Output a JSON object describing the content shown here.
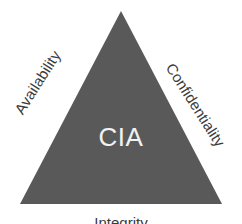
{
  "diagram": {
    "type": "triangle",
    "center_label": "CIA",
    "center_label_color": "#f2f2f2",
    "shape_fill_color": "#595959",
    "background_color": "#ffffff",
    "label_color": "#3b3b3b",
    "edges": [
      {
        "id": "availability",
        "label": "Availability",
        "side": "left",
        "rotation_deg": -57.5
      },
      {
        "id": "confidentiality",
        "label": "Confidentiality",
        "side": "right",
        "rotation_deg": 57.5
      },
      {
        "id": "integrity",
        "label": "Integrity",
        "side": "bottom",
        "rotation_deg": 0
      }
    ],
    "vertices": {
      "apex": "121,11",
      "bottom_left": "20,204",
      "bottom_right": "222,204"
    },
    "polygon_points": "121,11 222,204 20,204"
  }
}
